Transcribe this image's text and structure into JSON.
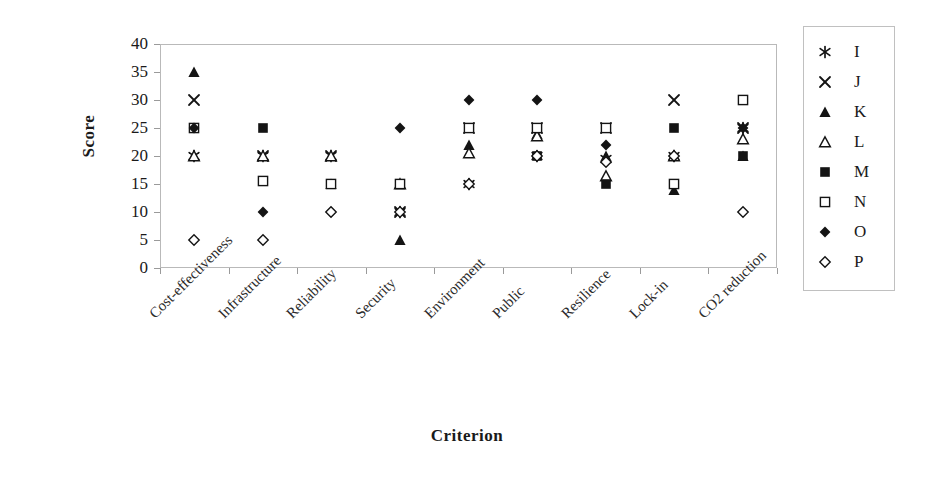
{
  "chart_data": {
    "type": "scatter",
    "title": "",
    "xlabel": "Criterion",
    "ylabel": "Score",
    "ylim": [
      0,
      40
    ],
    "ytick_step": 5,
    "yticks": [
      0,
      5,
      10,
      15,
      20,
      25,
      30,
      35,
      40
    ],
    "grid": false,
    "legend_position": "right",
    "categories": [
      "Cost-effectiveness",
      "Infrastructure",
      "Reliability",
      "Security",
      "Environment",
      "Public",
      "Resilience",
      "Lock-in",
      "CO2 reduction"
    ],
    "series": [
      {
        "name": "I",
        "marker": "asterisk",
        "values": [
          20,
          20,
          20,
          10,
          15,
          20,
          19.5,
          20,
          25
        ]
      },
      {
        "name": "J",
        "marker": "cross",
        "values": [
          30,
          20,
          20,
          10,
          25,
          25,
          25,
          30,
          25
        ]
      },
      {
        "name": "K",
        "marker": "filled-triangle",
        "values": [
          35,
          20,
          15,
          5,
          22,
          24,
          20,
          14,
          20
        ]
      },
      {
        "name": "L",
        "marker": "open-triangle",
        "values": [
          20,
          20,
          20,
          15,
          20.5,
          23.5,
          16.5,
          20,
          23
        ]
      },
      {
        "name": "M",
        "marker": "filled-square",
        "values": [
          25,
          25,
          15,
          15,
          25,
          20,
          15,
          25,
          20
        ]
      },
      {
        "name": "N",
        "marker": "open-square",
        "values": [
          25,
          15.5,
          15,
          15,
          25,
          25,
          25,
          15,
          30
        ]
      },
      {
        "name": "O",
        "marker": "filled-diamond",
        "values": [
          25,
          10,
          10,
          25,
          30,
          30,
          22,
          20,
          25
        ]
      },
      {
        "name": "P",
        "marker": "open-diamond",
        "values": [
          5,
          5,
          10,
          10,
          15,
          20,
          19,
          20,
          10
        ]
      }
    ]
  },
  "legend": {
    "entries": [
      {
        "label": "I",
        "marker": "asterisk"
      },
      {
        "label": "J",
        "marker": "cross"
      },
      {
        "label": "K",
        "marker": "filled-triangle"
      },
      {
        "label": "L",
        "marker": "open-triangle"
      },
      {
        "label": "M",
        "marker": "filled-square"
      },
      {
        "label": "N",
        "marker": "open-square"
      },
      {
        "label": "O",
        "marker": "filled-diamond"
      },
      {
        "label": "P",
        "marker": "open-diamond"
      }
    ]
  },
  "colors": {
    "marker": "#141414",
    "frame": "#b9b9b9",
    "text": "#1a1a1a"
  }
}
